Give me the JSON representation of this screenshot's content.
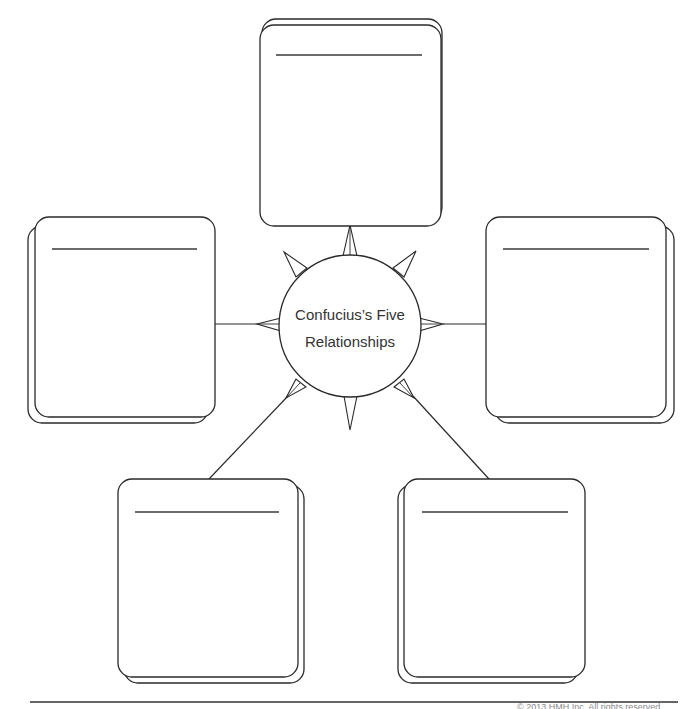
{
  "diagram": {
    "type": "spider-map graphic organizer",
    "center": {
      "line1": "Confucius’s Five",
      "line2": "Relationships"
    },
    "boxes": [
      {
        "id": "top",
        "title": "",
        "body": ""
      },
      {
        "id": "left",
        "title": "",
        "body": ""
      },
      {
        "id": "right",
        "title": "",
        "body": ""
      },
      {
        "id": "bottom-left",
        "title": "",
        "body": ""
      },
      {
        "id": "bottom-right",
        "title": "",
        "body": ""
      }
    ]
  },
  "footer": {
    "copyright": "© 2013 HMH Inc. All rights reserved."
  },
  "colors": {
    "stroke": "#2a2a2a",
    "background": "#ffffff",
    "text": "#333333",
    "footer_text": "#8a8a8a"
  }
}
